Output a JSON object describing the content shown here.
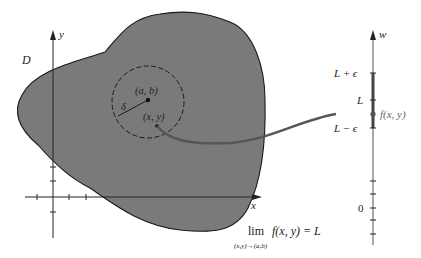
{
  "diagram": {
    "region_label": "D",
    "x_axis_label": "x",
    "y_axis_label": "y",
    "w_axis_label": "w",
    "center_point_label": "(a, b)",
    "near_point_label": "(x, y)",
    "radius_label": "δ",
    "w_ticks": {
      "upper": "L + ϵ",
      "middle": "L",
      "lower": "L − ϵ",
      "zero": "0"
    },
    "image_label": "f(x, y)",
    "limit_expression": {
      "operator": "lim",
      "subscript": "(x,y)→(a,b)",
      "body": "f(x, y) = L"
    },
    "colors": {
      "region_fill": "#7a7a7a",
      "outline": "#1a1a1a",
      "mapping_curve": "#555555",
      "epsilon_interval": "#444444"
    }
  }
}
